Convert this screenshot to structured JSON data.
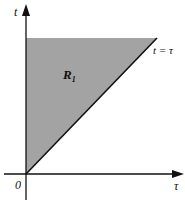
{
  "diagram": {
    "axes": {
      "x_label": "τ",
      "y_label": "t",
      "origin_label": "0"
    },
    "region": {
      "label": "R",
      "subscript": "1",
      "fill_color": "#a3a3a3"
    },
    "line": {
      "label": "t = τ"
    }
  }
}
